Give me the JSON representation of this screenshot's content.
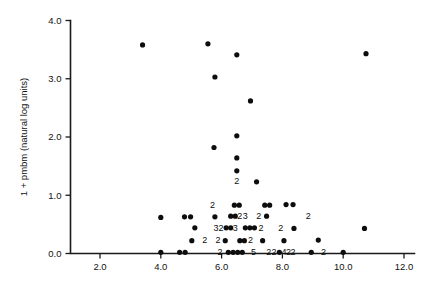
{
  "chart_data": {
    "type": "scatter",
    "title": "",
    "xlabel": "",
    "ylabel": "1 + pmbm (natural log units)",
    "xlim": [
      1.0,
      12.6
    ],
    "ylim": [
      -0.18,
      4.0
    ],
    "grid": false,
    "legend": null,
    "xticks": [
      "2.0",
      "4.0",
      "6.0",
      "8.0",
      "10.0",
      "12.0"
    ],
    "xtick_values": [
      2.0,
      4.0,
      6.0,
      8.0,
      10.0,
      12.0
    ],
    "yticks": [
      "0.0",
      "1.0",
      "2.0",
      "3.0",
      "4.0"
    ],
    "ytick_values": [
      0.0,
      1.0,
      2.0,
      3.0,
      4.0
    ],
    "marker": "filled-circle",
    "marker_color": "#0d0d0d",
    "note": "Numeric text labels next to markers indicate overlapping-point multiplicity",
    "points": [
      {
        "x": 3.4,
        "y": 3.58,
        "n": 1
      },
      {
        "x": 5.55,
        "y": 3.6,
        "n": 1
      },
      {
        "x": 6.5,
        "y": 3.41,
        "n": 1
      },
      {
        "x": 10.75,
        "y": 3.43,
        "n": 1
      },
      {
        "x": 5.78,
        "y": 3.03,
        "n": 1
      },
      {
        "x": 6.95,
        "y": 2.62,
        "n": 1
      },
      {
        "x": 6.5,
        "y": 2.02,
        "n": 1
      },
      {
        "x": 5.75,
        "y": 1.82,
        "n": 1
      },
      {
        "x": 6.5,
        "y": 1.64,
        "n": 1
      },
      {
        "x": 6.5,
        "y": 1.42,
        "n": 1
      },
      {
        "x": 6.5,
        "y": 1.24,
        "n": 2
      },
      {
        "x": 7.15,
        "y": 1.23,
        "n": 1
      },
      {
        "x": 5.7,
        "y": 0.83,
        "n": 2
      },
      {
        "x": 6.42,
        "y": 0.83,
        "n": 1
      },
      {
        "x": 6.58,
        "y": 0.83,
        "n": 1
      },
      {
        "x": 7.42,
        "y": 0.83,
        "n": 1
      },
      {
        "x": 7.58,
        "y": 0.83,
        "n": 1
      },
      {
        "x": 8.12,
        "y": 0.84,
        "n": 1
      },
      {
        "x": 8.35,
        "y": 0.84,
        "n": 1
      },
      {
        "x": 4.0,
        "y": 0.62,
        "n": 1
      },
      {
        "x": 4.78,
        "y": 0.63,
        "n": 1
      },
      {
        "x": 4.98,
        "y": 0.63,
        "n": 1
      },
      {
        "x": 5.78,
        "y": 0.63,
        "n": 1
      },
      {
        "x": 6.3,
        "y": 0.64,
        "n": 1
      },
      {
        "x": 6.45,
        "y": 0.64,
        "n": 1
      },
      {
        "x": 6.6,
        "y": 0.64,
        "n": 2
      },
      {
        "x": 6.78,
        "y": 0.64,
        "n": 3
      },
      {
        "x": 7.22,
        "y": 0.64,
        "n": 2
      },
      {
        "x": 7.48,
        "y": 0.64,
        "n": 1
      },
      {
        "x": 8.85,
        "y": 0.64,
        "n": 2
      },
      {
        "x": 5.12,
        "y": 0.44,
        "n": 1
      },
      {
        "x": 5.82,
        "y": 0.44,
        "n": 3
      },
      {
        "x": 5.98,
        "y": 0.44,
        "n": 2
      },
      {
        "x": 6.15,
        "y": 0.44,
        "n": 1
      },
      {
        "x": 6.3,
        "y": 0.44,
        "n": 1
      },
      {
        "x": 6.45,
        "y": 0.44,
        "n": 3
      },
      {
        "x": 6.78,
        "y": 0.44,
        "n": 1
      },
      {
        "x": 6.93,
        "y": 0.44,
        "n": 1
      },
      {
        "x": 7.08,
        "y": 0.44,
        "n": 1
      },
      {
        "x": 7.3,
        "y": 0.44,
        "n": 2
      },
      {
        "x": 7.95,
        "y": 0.44,
        "n": 2
      },
      {
        "x": 8.38,
        "y": 0.43,
        "n": 1
      },
      {
        "x": 10.7,
        "y": 0.43,
        "n": 1
      },
      {
        "x": 5.02,
        "y": 0.22,
        "n": 1
      },
      {
        "x": 5.45,
        "y": 0.22,
        "n": 2
      },
      {
        "x": 5.88,
        "y": 0.22,
        "n": 2
      },
      {
        "x": 6.12,
        "y": 0.22,
        "n": 1
      },
      {
        "x": 6.6,
        "y": 0.22,
        "n": 1
      },
      {
        "x": 6.75,
        "y": 0.22,
        "n": 1
      },
      {
        "x": 6.95,
        "y": 0.22,
        "n": 2
      },
      {
        "x": 7.35,
        "y": 0.22,
        "n": 1
      },
      {
        "x": 8.05,
        "y": 0.22,
        "n": 1
      },
      {
        "x": 9.18,
        "y": 0.23,
        "n": 1
      },
      {
        "x": 4.0,
        "y": 0.02,
        "n": 1
      },
      {
        "x": 4.62,
        "y": 0.02,
        "n": 1
      },
      {
        "x": 4.8,
        "y": 0.02,
        "n": 1
      },
      {
        "x": 5.95,
        "y": 0.02,
        "n": 2
      },
      {
        "x": 6.22,
        "y": 0.02,
        "n": 1
      },
      {
        "x": 6.38,
        "y": 0.02,
        "n": 1
      },
      {
        "x": 6.53,
        "y": 0.02,
        "n": 1
      },
      {
        "x": 6.68,
        "y": 0.02,
        "n": 1
      },
      {
        "x": 7.05,
        "y": 0.02,
        "n": 5
      },
      {
        "x": 7.55,
        "y": 0.02,
        "n": 2
      },
      {
        "x": 7.72,
        "y": 0.02,
        "n": 2
      },
      {
        "x": 7.9,
        "y": 0.02,
        "n": 1
      },
      {
        "x": 8.05,
        "y": 0.02,
        "n": 4
      },
      {
        "x": 8.2,
        "y": 0.02,
        "n": 2
      },
      {
        "x": 8.35,
        "y": 0.02,
        "n": 2
      },
      {
        "x": 8.95,
        "y": 0.02,
        "n": 1
      },
      {
        "x": 9.35,
        "y": 0.02,
        "n": 2
      },
      {
        "x": 10.0,
        "y": 0.02,
        "n": 1
      }
    ]
  }
}
